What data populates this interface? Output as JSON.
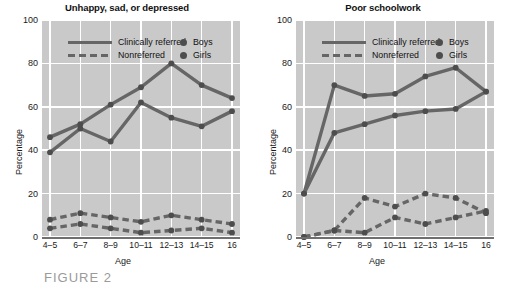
{
  "figure": {
    "caption": "FIGURE 2"
  },
  "axis": {
    "xlabel": "Age",
    "ylabel": "Percentage",
    "yticks": [
      0,
      20,
      40,
      60,
      80,
      100
    ],
    "categories": [
      "4–5",
      "6–7",
      "8–9",
      "10–11",
      "12–13",
      "14–15",
      "16"
    ]
  },
  "legend": {
    "clinically_referred": "Clinically referred",
    "nonreferred": "Nonreferred",
    "boys": "Boys",
    "girls": "Girls"
  },
  "colors": {
    "plot_background": "#c9c9c9",
    "gridline": "#ffffff",
    "line": "#666666",
    "marker": "#4d4d4d",
    "axis": "#6f6f6f",
    "text": "#1a1a1a"
  },
  "chart_data": [
    {
      "type": "line",
      "title": "Unhappy, sad, or depressed",
      "xlabel": "Age",
      "ylabel": "Percentage",
      "ylim": [
        0,
        100
      ],
      "grid": true,
      "legend_position": "top-inside",
      "categories": [
        "4–5",
        "6–7",
        "8–9",
        "10–11",
        "12–13",
        "14–15",
        "16"
      ],
      "series": [
        {
          "name": "Clinically referred — Boys",
          "group": "Clinically referred",
          "sex": "Boys",
          "style": "solid",
          "values": [
            46,
            52,
            61,
            69,
            80,
            70,
            64
          ]
        },
        {
          "name": "Clinically referred — Girls",
          "group": "Clinically referred",
          "sex": "Girls",
          "style": "solid",
          "values": [
            39,
            50,
            44,
            62,
            55,
            51,
            58
          ]
        },
        {
          "name": "Nonreferred — Boys",
          "group": "Nonreferred",
          "sex": "Boys",
          "style": "dashed",
          "values": [
            8,
            11,
            9,
            7,
            10,
            8,
            6
          ]
        },
        {
          "name": "Nonreferred — Girls",
          "group": "Nonreferred",
          "sex": "Girls",
          "style": "dashed",
          "values": [
            4,
            6,
            4,
            2,
            3,
            4,
            2
          ]
        }
      ]
    },
    {
      "type": "line",
      "title": "Poor schoolwork",
      "xlabel": "Age",
      "ylabel": "Percentage",
      "ylim": [
        0,
        100
      ],
      "grid": true,
      "legend_position": "top-inside",
      "categories": [
        "4–5",
        "6–7",
        "8–9",
        "10–11",
        "12–13",
        "14–15",
        "16"
      ],
      "series": [
        {
          "name": "Clinically referred — Boys",
          "group": "Clinically referred",
          "sex": "Boys",
          "style": "solid",
          "values": [
            20,
            70,
            65,
            66,
            74,
            78,
            67
          ]
        },
        {
          "name": "Clinically referred — Girls",
          "group": "Clinically referred",
          "sex": "Girls",
          "style": "solid",
          "values": [
            20,
            48,
            52,
            56,
            58,
            59,
            67
          ]
        },
        {
          "name": "Nonreferred — Boys",
          "group": "Nonreferred",
          "sex": "Boys",
          "style": "dashed",
          "values": [
            0,
            3,
            18,
            14,
            20,
            18,
            11
          ]
        },
        {
          "name": "Nonreferred — Girls",
          "group": "Nonreferred",
          "sex": "Girls",
          "style": "dashed",
          "values": [
            0,
            3,
            2,
            9,
            6,
            9,
            12
          ]
        }
      ]
    }
  ]
}
